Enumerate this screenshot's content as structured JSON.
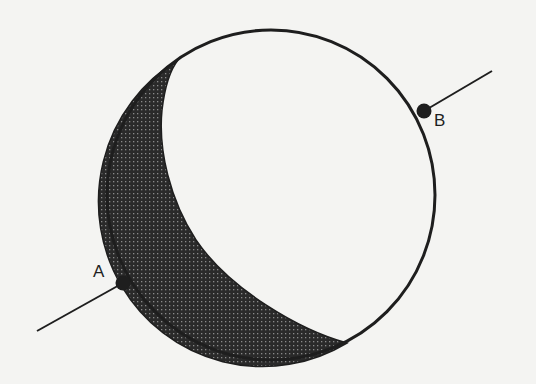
{
  "diagram": {
    "type": "sphere-with-axis",
    "colors": {
      "background": "#f4f4f2",
      "stroke": "#1e1e1e",
      "shade_fill": "#2a2a2a",
      "shade_dot": "#8a8a8a"
    },
    "sphere": {
      "cx": 271,
      "cy": 195,
      "rx": 164,
      "ry": 165
    },
    "points": [
      {
        "id": "A",
        "label": "A",
        "x": 123,
        "y": 283,
        "label_x": 93,
        "label_y": 263
      },
      {
        "id": "B",
        "label": "B",
        "x": 424,
        "y": 111,
        "label_x": 434,
        "label_y": 112
      }
    ],
    "axis": {
      "segment_A": {
        "x1": 37,
        "y1": 331,
        "x2": 123,
        "y2": 283
      },
      "segment_B": {
        "x1": 424,
        "y1": 111,
        "x2": 492,
        "y2": 71
      }
    },
    "shaded_region": {
      "shape": "crescent",
      "top_tip": {
        "x": 178,
        "y": 60
      },
      "bottom_tip": {
        "x": 347,
        "y": 343
      }
    }
  }
}
